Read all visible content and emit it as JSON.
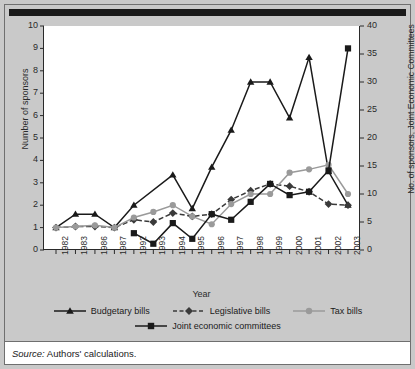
{
  "chart_data": {
    "type": "line",
    "title": "",
    "xlabel": "Year",
    "ylabel": "Number of sponsors",
    "ylabel_right": "No. of sponsors, Joint Economic Committees",
    "categories": [
      "1982",
      "1983",
      "1986",
      "1987",
      "1992",
      "1993",
      "1994",
      "1995",
      "1996",
      "1997",
      "1998",
      "1999",
      "2000",
      "2001",
      "2002",
      "2003"
    ],
    "ylim": [
      0,
      10
    ],
    "yticks": [
      0,
      1,
      2,
      3,
      4,
      5,
      6,
      7,
      8,
      9,
      10
    ],
    "ylim_right": [
      0,
      40
    ],
    "yticks_right": [
      0,
      5,
      10,
      15,
      20,
      25,
      30,
      35,
      40
    ],
    "grid": false,
    "legend_position": "bottom",
    "series": [
      {
        "name": "Budgetary bills",
        "axis": "left",
        "color": "#1a1a1a",
        "marker": "triangle",
        "dash": "solid",
        "values": [
          1.0,
          1.6,
          1.6,
          1.0,
          2.0,
          null,
          3.35,
          1.85,
          3.7,
          5.35,
          7.5,
          7.5,
          5.9,
          8.6,
          3.5,
          2.0
        ]
      },
      {
        "name": "Legislative bills",
        "axis": "left",
        "color": "#3a3a3a",
        "marker": "diamond",
        "dash": "dashed",
        "values": [
          1.0,
          1.05,
          1.05,
          1.0,
          1.35,
          1.25,
          1.65,
          1.5,
          1.6,
          2.25,
          2.65,
          2.95,
          2.85,
          2.6,
          2.05,
          2.0
        ]
      },
      {
        "name": "Tax bills",
        "axis": "left",
        "color": "#9a9a9a",
        "marker": "circle",
        "dash": "solid",
        "values": [
          1.0,
          1.05,
          1.1,
          1.0,
          1.45,
          1.7,
          2.0,
          1.5,
          1.15,
          2.05,
          2.5,
          2.5,
          3.45,
          3.6,
          3.8,
          2.5
        ]
      },
      {
        "name": "Joint economic committees",
        "axis": "right",
        "color": "#1a1a1a",
        "marker": "square",
        "dash": "solid",
        "values": [
          null,
          null,
          null,
          null,
          3.0,
          1.1,
          4.8,
          2.0,
          6.4,
          5.4,
          8.6,
          11.8,
          9.8,
          10.4,
          14.2,
          36.0
        ],
        "values_left_scale": [
          null,
          null,
          null,
          null,
          0.75,
          0.28,
          1.2,
          0.5,
          1.6,
          1.35,
          2.15,
          2.95,
          2.45,
          2.6,
          3.55,
          9.0
        ]
      }
    ]
  },
  "legend": {
    "rows": [
      [
        "Budgetary bills",
        "Legislative bills",
        "Tax bills"
      ],
      [
        "Joint economic committees"
      ]
    ]
  },
  "source": {
    "prefix": "Source:",
    "text": "Authors' calculations."
  }
}
